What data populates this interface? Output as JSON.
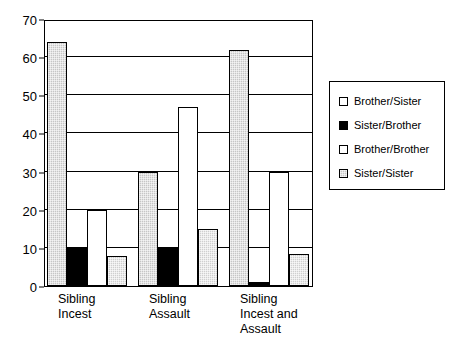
{
  "chart_data": {
    "type": "bar",
    "title": "",
    "xlabel": "",
    "ylabel": "",
    "ylim": [
      0,
      70
    ],
    "ytick_step": 10,
    "yticks": [
      0,
      10,
      20,
      30,
      40,
      50,
      60,
      70
    ],
    "grid": true,
    "legend_position": "right",
    "categories": [
      "Sibling\nIncest",
      "Sibling\nAssault",
      "Sibling\nIncest and\nAssault"
    ],
    "bar_order": [
      "Sister/Sister",
      "Sister/Brother",
      "Brother/Brother",
      "Brother/Sister"
    ],
    "series": [
      {
        "name": "Brother/Sister",
        "fill": "white",
        "values": [
          8,
          15,
          8.5
        ]
      },
      {
        "name": "Sister/Brother",
        "fill": "black",
        "values": [
          10,
          10,
          1
        ]
      },
      {
        "name": "Brother/Brother",
        "fill": "white",
        "values": [
          20,
          47,
          30
        ]
      },
      {
        "name": "Sister/Sister",
        "fill": "gray-hatch",
        "values": [
          64,
          30,
          62
        ]
      }
    ]
  },
  "legend": {
    "items": [
      {
        "label": "Brother/Sister",
        "swatch": "white"
      },
      {
        "label": "Sister/Brother",
        "swatch": "black"
      },
      {
        "label": "Brother/Brother",
        "swatch": "white"
      },
      {
        "label": "Sister/Sister",
        "swatch": "gray"
      }
    ]
  },
  "colors": {
    "gray_fill": "#c6c6c6",
    "light_gray_fill": "#cfcfcf",
    "black_fill": "#000000",
    "white_fill": "#ffffff",
    "axis": "#000000"
  }
}
